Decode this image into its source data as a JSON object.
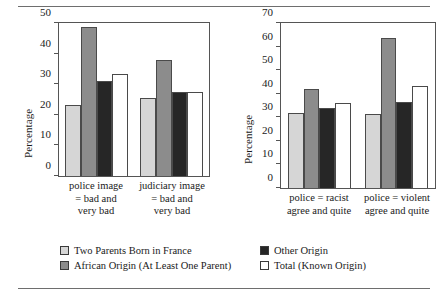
{
  "chart_data": [
    {
      "type": "bar",
      "panel": "left",
      "title": "",
      "xlabel": "",
      "ylabel": "Percentage",
      "ylim": [
        0,
        50
      ],
      "yticks": [
        0,
        10,
        20,
        30,
        40,
        50
      ],
      "grid": false,
      "legend_position": "bottom",
      "categories": [
        "police image = bad and very bad",
        "judiciary image = bad and very bad"
      ],
      "category_lines": [
        [
          "police image",
          "= bad and",
          "very bad"
        ],
        [
          "judiciary image",
          "= bad and",
          "very bad"
        ]
      ],
      "series": [
        {
          "name": "Two Parents Born in France",
          "color": "#d6d6d6",
          "values": [
            23.2,
            25.5
          ]
        },
        {
          "name": "African Origin (At Least One Parent)",
          "color": "#8c8c8c",
          "values": [
            48.6,
            37.8
          ]
        },
        {
          "name": "Other Origin",
          "color": "#262626",
          "values": [
            31.2,
            27.4
          ]
        },
        {
          "name": "Total (Known Origin)",
          "color": "#ffffff",
          "values": [
            33.2,
            27.6
          ]
        }
      ]
    },
    {
      "type": "bar",
      "panel": "right",
      "title": "",
      "xlabel": "",
      "ylabel": "Percentage",
      "ylim": [
        0,
        70
      ],
      "yticks": [
        0,
        10,
        20,
        30,
        40,
        50,
        60,
        70
      ],
      "grid": false,
      "legend_position": "bottom",
      "categories": [
        "police = racist agree and quite",
        "police = violent agree and quite"
      ],
      "category_lines": [
        [
          "police = racist",
          "agree and quite"
        ],
        [
          "police = violent",
          "agree and quite"
        ]
      ],
      "series": [
        {
          "name": "Two Parents Born in France",
          "color": "#d6d6d6",
          "values": [
            31.8,
            31.2
          ]
        },
        {
          "name": "African Origin (At Least One Parent)",
          "color": "#8c8c8c",
          "values": [
            42.0,
            63.8
          ]
        },
        {
          "name": "Other Origin",
          "color": "#262626",
          "values": [
            33.8,
            36.6
          ]
        },
        {
          "name": "Total (Known Origin)",
          "color": "#ffffff",
          "values": [
            36.2,
            43.2
          ]
        }
      ]
    }
  ],
  "legend": {
    "items": [
      {
        "label": "Two Parents Born in France",
        "color": "#d6d6d6"
      },
      {
        "label": "Other Origin",
        "color": "#262626"
      },
      {
        "label": "African Origin (At Least One Parent)",
        "color": "#8c8c8c"
      },
      {
        "label": "Total (Known Origin)",
        "color": "#ffffff"
      }
    ]
  }
}
